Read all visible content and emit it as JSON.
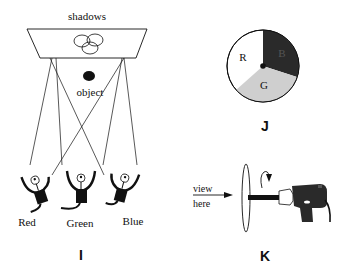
{
  "panel_i": {
    "label": "I",
    "screen_label": "shadows",
    "object_label": "object",
    "lamps": [
      {
        "label": "Red"
      },
      {
        "label": "Green"
      },
      {
        "label": "Blue"
      }
    ]
  },
  "panel_j": {
    "label": "J",
    "disc": {
      "segments": [
        {
          "label": "R",
          "color": "#ffffff"
        },
        {
          "label": "B",
          "color": "#2a2a2a"
        },
        {
          "label": "G",
          "color": "#cfcfcf"
        }
      ]
    }
  },
  "panel_k": {
    "label": "K",
    "view_label_line1": "view",
    "view_label_line2": "here"
  }
}
